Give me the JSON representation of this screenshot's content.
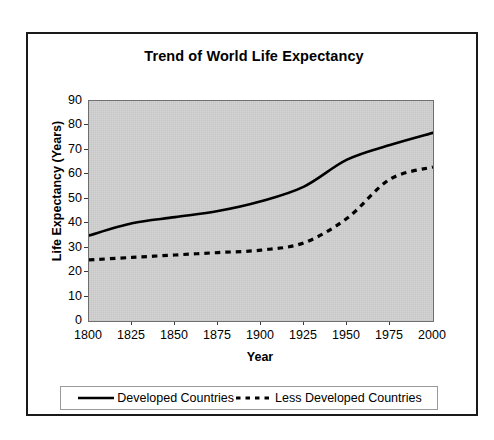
{
  "chart_data": {
    "type": "line",
    "title": "Trend of World Life Expectancy",
    "xlabel": "Year",
    "ylabel": "Life Expectancy (Years)",
    "x": [
      1800,
      1825,
      1850,
      1875,
      1900,
      1925,
      1950,
      1975,
      2000
    ],
    "xlim": [
      1800,
      2000
    ],
    "ylim": [
      0,
      90
    ],
    "ytick_labels": [
      "90",
      "80",
      "70",
      "60",
      "50",
      "40",
      "30",
      "20",
      "10",
      "0"
    ],
    "ytick_values": [
      90,
      80,
      70,
      60,
      50,
      40,
      30,
      20,
      10,
      0
    ],
    "xtick_labels": [
      "1800",
      "1825",
      "1850",
      "1875",
      "1900",
      "1925",
      "1950",
      "1975",
      "2000"
    ],
    "grid": false,
    "legend_position": "bottom",
    "plot_background": "#d4d4d4",
    "series": [
      {
        "name": "Developed Countries",
        "style": "solid",
        "color": "#000000",
        "values": [
          35,
          40,
          42.5,
          45,
          49,
          55,
          66,
          72,
          77
        ]
      },
      {
        "name": "Less Developed Countries",
        "style": "dashed",
        "color": "#000000",
        "values": [
          25,
          26,
          27,
          28,
          29,
          32,
          42,
          58,
          63
        ]
      }
    ]
  },
  "legend": {
    "entries": [
      {
        "label": "Developed Countries",
        "style": "solid"
      },
      {
        "label": "Less Developed Countries",
        "style": "dashed"
      }
    ]
  }
}
